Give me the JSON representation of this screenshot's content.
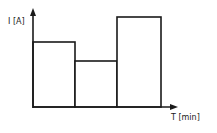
{
  "chart_data": {
    "type": "bar",
    "title": "",
    "xlabel": "T [min]",
    "ylabel": "I [A]",
    "categories": [
      "interval 1",
      "interval 2",
      "interval 3"
    ],
    "values": [
      65,
      46,
      90
    ],
    "value_note": "no tick values shown; values are relative bar heights in pixels above baseline",
    "ylim": [
      0,
      95
    ],
    "grid": false,
    "legend": "none",
    "bar_style": "adjacent unfilled rectangles, black outline",
    "colors": {
      "stroke": "#1a1a1a",
      "fill": "#ffffff"
    }
  }
}
